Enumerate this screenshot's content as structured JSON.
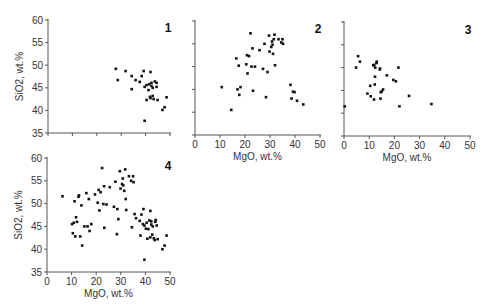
{
  "figure": {
    "background": "#ffffff",
    "point_color": "#111111",
    "axis_color": "#555555"
  },
  "chart_data": [
    {
      "type": "scatter",
      "panel_label": "1",
      "title": "",
      "xlabel": "",
      "ylabel": "SiO2, wt.%",
      "xlim": [
        0,
        50
      ],
      "ylim": [
        35,
        60
      ],
      "xticks": [
        0,
        10,
        20,
        30,
        40,
        50
      ],
      "xtick_labels_visible": false,
      "yticks": [
        35,
        40,
        45,
        50,
        55,
        60
      ],
      "ytick_labels": [
        "35",
        "40",
        "45",
        "50",
        "55",
        "60"
      ],
      "layout": {
        "x0": 48,
        "x1": 170,
        "y0": 133,
        "y1": 20
      },
      "points": [
        [
          27.8,
          49.2
        ],
        [
          28.6,
          46.7
        ],
        [
          31.8,
          48.7
        ],
        [
          34.3,
          47.6
        ],
        [
          34.3,
          44.7
        ],
        [
          35.9,
          46.7
        ],
        [
          37.6,
          46.3
        ],
        [
          38.4,
          47.6
        ],
        [
          39.2,
          48.7
        ],
        [
          39.6,
          45.2
        ],
        [
          40.4,
          45.6
        ],
        [
          40.4,
          42.3
        ],
        [
          41.2,
          44.5
        ],
        [
          42.0,
          48.5
        ],
        [
          42.0,
          42.7
        ],
        [
          42.4,
          46.1
        ],
        [
          42.4,
          45.4
        ],
        [
          42.9,
          43.2
        ],
        [
          42.9,
          45.0
        ],
        [
          43.3,
          42.5
        ],
        [
          44.5,
          46.1
        ],
        [
          44.5,
          45.2
        ],
        [
          44.9,
          42.3
        ],
        [
          39.6,
          37.7
        ],
        [
          46.9,
          40.1
        ],
        [
          47.8,
          40.7
        ],
        [
          48.6,
          42.9
        ],
        [
          41.5,
          45.8
        ],
        [
          43.8,
          46.4
        ],
        [
          41.8,
          43.0
        ]
      ]
    },
    {
      "type": "scatter",
      "panel_label": "2",
      "title": "",
      "xlabel": "MgO, wt.%",
      "ylabel": "",
      "xlim": [
        0,
        50
      ],
      "ylim": [
        35,
        60
      ],
      "xticks": [
        0,
        10,
        20,
        30,
        40,
        50
      ],
      "xtick_labels": [
        "0",
        "10",
        "20",
        "30",
        "40",
        "50"
      ],
      "yticks": [
        35,
        40,
        45,
        50,
        55,
        60
      ],
      "ytick_labels_visible": false,
      "layout": {
        "x0": 195,
        "x1": 320,
        "y0": 135,
        "y1": 21
      },
      "points": [
        [
          10.7,
          45.5
        ],
        [
          14.5,
          40.5
        ],
        [
          16.5,
          51.8
        ],
        [
          17.0,
          45.0
        ],
        [
          17.5,
          50.2
        ],
        [
          17.7,
          43.8
        ],
        [
          18.2,
          45.5
        ],
        [
          20.5,
          50.5
        ],
        [
          20.8,
          52.5
        ],
        [
          21.0,
          48.5
        ],
        [
          21.6,
          52.3
        ],
        [
          22.2,
          57.3
        ],
        [
          22.6,
          50.0
        ],
        [
          23.0,
          54.0
        ],
        [
          23.2,
          44.7
        ],
        [
          24.0,
          50.0
        ],
        [
          25.8,
          53.6
        ],
        [
          27.2,
          49.5
        ],
        [
          27.8,
          55.0
        ],
        [
          28.4,
          43.3
        ],
        [
          29.0,
          48.8
        ],
        [
          29.6,
          56.8
        ],
        [
          29.8,
          53.3
        ],
        [
          30.5,
          54.3
        ],
        [
          30.8,
          55.5
        ],
        [
          31.0,
          54.8
        ],
        [
          31.2,
          52.8
        ],
        [
          31.5,
          56.0
        ],
        [
          31.8,
          57.0
        ],
        [
          32.0,
          50.3
        ],
        [
          33.4,
          56.0
        ],
        [
          34.5,
          55.3
        ],
        [
          35.0,
          56.0
        ],
        [
          35.2,
          55.0
        ],
        [
          38.2,
          46.0
        ],
        [
          38.6,
          43.0
        ],
        [
          39.2,
          44.5
        ],
        [
          39.8,
          44.4
        ],
        [
          40.8,
          42.5
        ],
        [
          43.3,
          41.7
        ]
      ]
    },
    {
      "type": "scatter",
      "panel_label": "3",
      "title": "",
      "xlabel": "MgO, wt.%",
      "ylabel": "",
      "xlim": [
        0,
        50
      ],
      "ylim": [
        35,
        60
      ],
      "xticks": [
        0,
        10,
        20,
        30,
        40,
        50
      ],
      "xtick_labels": [
        "0",
        "10",
        "20",
        "30",
        "40",
        "50"
      ],
      "yticks": [
        35,
        40,
        45,
        50,
        55,
        60
      ],
      "ytick_labels_visible": false,
      "layout": {
        "x0": 344,
        "x1": 470,
        "y0": 136,
        "y1": 22
      },
      "points": [
        [
          0.3,
          41.5
        ],
        [
          4.8,
          50.0
        ],
        [
          5.6,
          52.5
        ],
        [
          6.3,
          51.3
        ],
        [
          9.3,
          44.3
        ],
        [
          10.4,
          46.0
        ],
        [
          10.6,
          43.7
        ],
        [
          11.6,
          50.5
        ],
        [
          11.9,
          43.0
        ],
        [
          12.0,
          50.6
        ],
        [
          12.2,
          46.3
        ],
        [
          12.3,
          48.0
        ],
        [
          12.4,
          50.0
        ],
        [
          12.9,
          51.0
        ],
        [
          13.0,
          51.3
        ],
        [
          14.2,
          49.6
        ],
        [
          14.3,
          49.8
        ],
        [
          14.5,
          43.2
        ],
        [
          14.6,
          44.6
        ],
        [
          15.0,
          44.8
        ],
        [
          15.5,
          45.2
        ],
        [
          17.0,
          48.3
        ],
        [
          19.6,
          47.3
        ],
        [
          20.6,
          47.0
        ],
        [
          21.6,
          50.0
        ],
        [
          22.0,
          41.5
        ],
        [
          25.8,
          43.8
        ],
        [
          34.7,
          42.0
        ]
      ]
    },
    {
      "type": "scatter",
      "panel_label": "4",
      "title": "",
      "xlabel": "MgO, wt.%",
      "ylabel": "SiO2, wt.%",
      "xlim": [
        0,
        50
      ],
      "ylim": [
        35,
        60
      ],
      "xticks": [
        0,
        10,
        20,
        30,
        40,
        50
      ],
      "xtick_labels": [
        "0",
        "10",
        "20",
        "30",
        "40",
        "50"
      ],
      "yticks": [
        35,
        40,
        45,
        50,
        55,
        60
      ],
      "ytick_labels": [
        "35",
        "40",
        "45",
        "50",
        "55",
        "60"
      ],
      "layout": {
        "x0": 47,
        "x1": 170,
        "y0": 272,
        "y1": 158
      },
      "points": [
        [
          6.3,
          51.6
        ],
        [
          10.2,
          45.5
        ],
        [
          10.5,
          43.5
        ],
        [
          10.9,
          45.8
        ],
        [
          11.2,
          50.5
        ],
        [
          11.5,
          42.8
        ],
        [
          11.8,
          47.0
        ],
        [
          12.2,
          46.0
        ],
        [
          12.8,
          51.5
        ],
        [
          13.0,
          51.8
        ],
        [
          13.5,
          42.8
        ],
        [
          14.0,
          49.6
        ],
        [
          14.3,
          40.8
        ],
        [
          15.2,
          45.0
        ],
        [
          16.0,
          52.3
        ],
        [
          16.5,
          45.0
        ],
        [
          17.0,
          51.0
        ],
        [
          17.3,
          44.0
        ],
        [
          18.0,
          45.5
        ],
        [
          19.5,
          52.0
        ],
        [
          20.6,
          50.2
        ],
        [
          21.0,
          53.0
        ],
        [
          21.3,
          48.5
        ],
        [
          21.8,
          52.5
        ],
        [
          22.4,
          57.8
        ],
        [
          22.9,
          49.9
        ],
        [
          23.2,
          53.8
        ],
        [
          23.3,
          44.7
        ],
        [
          24.2,
          49.8
        ],
        [
          25.5,
          53.6
        ],
        [
          27.2,
          49.3
        ],
        [
          27.8,
          54.8
        ],
        [
          28.4,
          43.3
        ],
        [
          28.6,
          48.8
        ],
        [
          29.0,
          46.6
        ],
        [
          29.6,
          57.1
        ],
        [
          29.9,
          53.3
        ],
        [
          30.5,
          54.3
        ],
        [
          30.8,
          55.5
        ],
        [
          31.0,
          54.0
        ],
        [
          31.4,
          52.8
        ],
        [
          31.8,
          57.5
        ],
        [
          32.0,
          51.0
        ],
        [
          32.2,
          48.6
        ],
        [
          33.3,
          56.0
        ],
        [
          34.2,
          55.0
        ],
        [
          34.5,
          44.8
        ],
        [
          35.0,
          56.0
        ],
        [
          35.2,
          54.7
        ],
        [
          35.6,
          47.7
        ],
        [
          36.2,
          46.8
        ],
        [
          37.7,
          46.2
        ],
        [
          38.0,
          43.0
        ],
        [
          38.4,
          47.6
        ],
        [
          39.2,
          48.8
        ],
        [
          39.6,
          45.2
        ],
        [
          39.6,
          37.7
        ],
        [
          40.2,
          44.5
        ],
        [
          40.5,
          45.8
        ],
        [
          40.8,
          42.3
        ],
        [
          41.2,
          44.4
        ],
        [
          42.0,
          48.4
        ],
        [
          42.0,
          42.6
        ],
        [
          42.4,
          46.1
        ],
        [
          42.4,
          45.4
        ],
        [
          42.8,
          43.2
        ],
        [
          43.0,
          45.0
        ],
        [
          43.4,
          42.4
        ],
        [
          44.2,
          46.4
        ],
        [
          44.6,
          45.2
        ],
        [
          45.0,
          42.2
        ],
        [
          46.9,
          40.0
        ],
        [
          47.8,
          40.8
        ],
        [
          48.6,
          43.0
        ],
        [
          39.0,
          45.5
        ],
        [
          41.6,
          46.3
        ],
        [
          43.8,
          42.0
        ],
        [
          44.0,
          46.0
        ]
      ]
    }
  ]
}
